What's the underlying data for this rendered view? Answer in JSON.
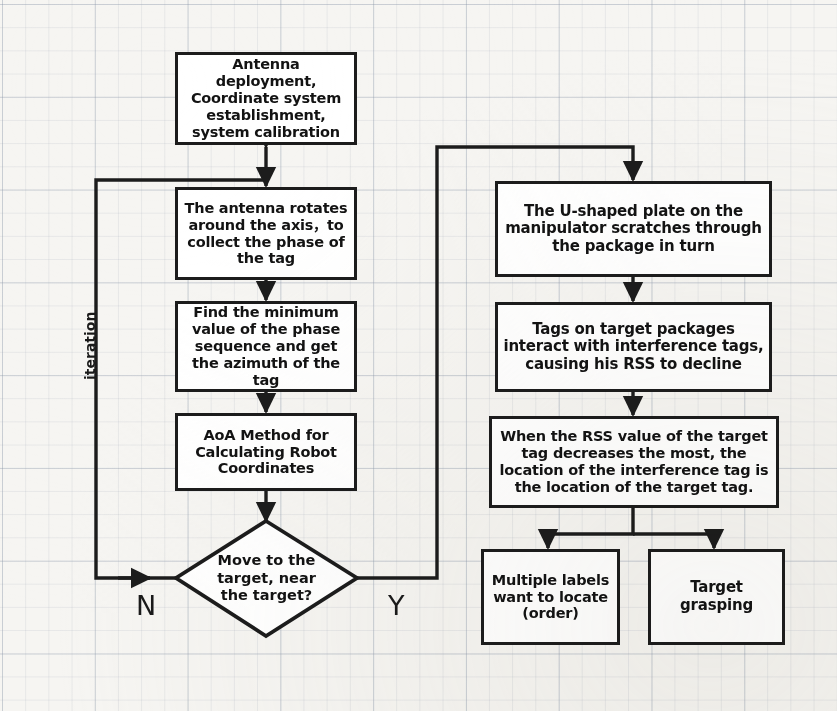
{
  "diagram": {
    "line_color": "#1c1c1c",
    "node_fill": "#ffffff",
    "background": "#f6f5f2",
    "nodes": [
      {
        "id": "setup",
        "shape": "process",
        "text": "Antenna deployment, Coordinate system establishment, system calibration"
      },
      {
        "id": "rotate",
        "shape": "process",
        "text": "The antenna rotates around the axis，to collect the phase of the tag"
      },
      {
        "id": "minphase",
        "shape": "process",
        "text": "Find the minimum value of the phase sequence and get the azimuth of the tag"
      },
      {
        "id": "aoa",
        "shape": "process",
        "text": "AoA Method for Calculating Robot Coordinates"
      },
      {
        "id": "decision",
        "shape": "decision",
        "text": "Move to the target, near the target?"
      },
      {
        "id": "uplate",
        "shape": "process",
        "text": "The U-shaped plate on the manipulator scratches through the package in turn"
      },
      {
        "id": "interact",
        "shape": "process",
        "text": "Tags on target packages interact with interference tags, causing his RSS to decline"
      },
      {
        "id": "rssrule",
        "shape": "process",
        "text": "When the RSS value of the target tag decreases the most, the location of the interference tag is the location of the target tag."
      },
      {
        "id": "multiple",
        "shape": "process",
        "text": "Multiple labels want to locate (order)"
      },
      {
        "id": "grasp",
        "shape": "process",
        "text": "Target grasping"
      }
    ],
    "edge_labels": {
      "no": "N",
      "yes": "Y",
      "iteration": "iteration"
    },
    "edges": [
      {
        "from": "setup",
        "to": "rotate",
        "type": "double-arrow"
      },
      {
        "from": "rotate",
        "to": "minphase",
        "type": "arrow"
      },
      {
        "from": "minphase",
        "to": "aoa",
        "type": "arrow"
      },
      {
        "from": "aoa",
        "to": "decision",
        "type": "arrow"
      },
      {
        "from": "decision",
        "to": "rotate",
        "label": "N",
        "type": "feedback-arrow"
      },
      {
        "from": "decision",
        "to": "uplate",
        "label": "Y",
        "type": "arrow"
      },
      {
        "from": "uplate",
        "to": "interact",
        "type": "arrow"
      },
      {
        "from": "interact",
        "to": "rssrule",
        "type": "arrow"
      },
      {
        "from": "rssrule",
        "to": "multiple",
        "type": "arrow"
      },
      {
        "from": "rssrule",
        "to": "grasp",
        "type": "arrow"
      }
    ]
  }
}
